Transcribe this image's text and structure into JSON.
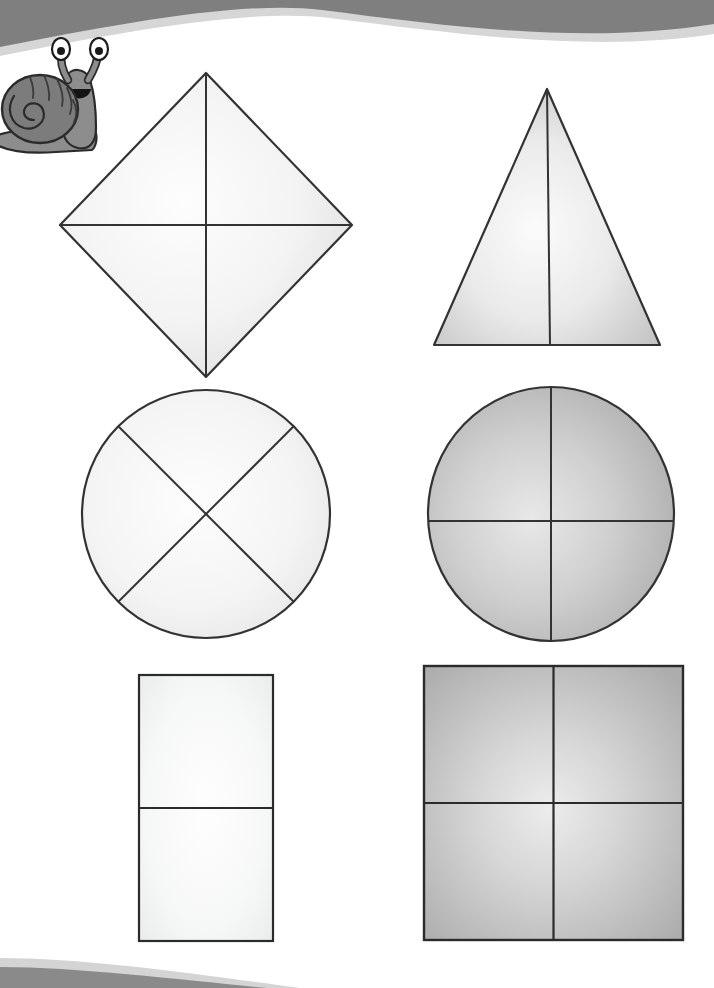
{
  "page": {
    "background_color": "#ffffff",
    "width": 714,
    "height": 988
  },
  "decorations": {
    "top_wave": {
      "name": "top-wave-banner",
      "fill_color": "#808080",
      "highlight_color": "#d9d9d9"
    },
    "bottom_wave": {
      "name": "bottom-wave-banner",
      "fill_color": "#808080",
      "highlight_color": "#d9d9d9"
    }
  },
  "mascot": {
    "name": "snail-mascot",
    "body_color": "#8a8a8a",
    "shell_color": "#7a7a7a",
    "outline_color": "#2b2b2b",
    "eye_white": "#ffffff",
    "eye_pupil": "#1a1a1a",
    "mouth_color": "#111111",
    "label": "snail"
  },
  "shapes": [
    {
      "id": "rhombus",
      "label": "Rhombus",
      "divisions": 4,
      "division_style": "vertical and horizontal diagonals",
      "fill_light": "#fafafa",
      "fill_dark": "#dcdcdc",
      "stroke_color": "#333333",
      "stroke_width": 2,
      "row": 1,
      "column": 1
    },
    {
      "id": "triangle",
      "label": "Triangle",
      "divisions": 2,
      "division_style": "vertical midline",
      "fill_light": "#f5f5f5",
      "fill_dark": "#c4c4c4",
      "stroke_color": "#333333",
      "stroke_width": 2,
      "row": 1,
      "column": 2
    },
    {
      "id": "circle-diagonal",
      "label": "Circle",
      "divisions": 4,
      "division_style": "diagonal cross",
      "fill_light": "#fbfbfb",
      "fill_dark": "#e4e4e4",
      "stroke_color": "#333333",
      "stroke_width": 2,
      "row": 2,
      "column": 1
    },
    {
      "id": "circle-cross",
      "label": "Circle",
      "divisions": 4,
      "division_style": "vertical and horizontal cross",
      "fill_light": "#e2e2e2",
      "fill_dark": "#a8a8a8",
      "stroke_color": "#333333",
      "stroke_width": 2,
      "row": 2,
      "column": 2
    },
    {
      "id": "rectangle",
      "label": "Rectangle",
      "divisions": 2,
      "division_style": "horizontal midline",
      "fill_light": "#fcfcfc",
      "fill_dark": "#eceded",
      "stroke_color": "#2b2b2b",
      "stroke_width": 2,
      "row": 3,
      "column": 1
    },
    {
      "id": "square",
      "label": "Square",
      "divisions": 4,
      "division_style": "vertical and horizontal midlines",
      "fill_light": "#e6e6e6",
      "fill_dark": "#b0b0b0",
      "stroke_color": "#2b2b2b",
      "stroke_width": 2,
      "row": 3,
      "column": 2
    }
  ],
  "geometry": {
    "rhombus": {
      "cx": 206,
      "cy": 225,
      "half_w": 146,
      "half_h": 152
    },
    "triangle": {
      "apex_x": 547,
      "apex_y": 89,
      "left_x": 434,
      "right_x": 660,
      "base_y": 345
    },
    "circle_diagonal": {
      "cx": 206,
      "cy": 514,
      "r": 124
    },
    "circle_cross": {
      "cx": 551,
      "cy": 514,
      "rx": 123,
      "ry": 127
    },
    "rectangle": {
      "x": 139,
      "y": 675,
      "w": 134,
      "h": 266
    },
    "square": {
      "x": 424,
      "y": 666,
      "w": 259,
      "h": 274
    }
  }
}
